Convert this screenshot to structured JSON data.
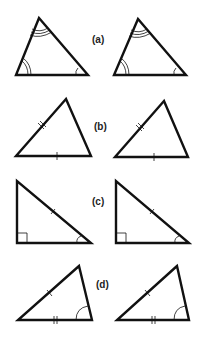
{
  "figure": {
    "line_color": "#111111",
    "background": "#ffffff"
  },
  "pairs": [
    {
      "label": "(a)",
      "criterion_marks": "three angles marked (single, double, triple arcs)"
    },
    {
      "label": "(b)",
      "criterion_marks": "two sides marked (single tick, double tick)"
    },
    {
      "label": "(c)",
      "criterion_marks": "right angle, one hypotenuse tick, one acute angle arc"
    },
    {
      "label": "(d)",
      "criterion_marks": "side single tick, base double tick, angle arc"
    }
  ]
}
